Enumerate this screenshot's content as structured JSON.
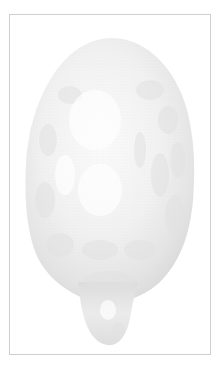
{
  "figure": {
    "colors": {
      "background": "#ffffff",
      "frame_border": "#cfcfcf",
      "body_light": "#f2f2f2",
      "body_mid": "#e3e3e3",
      "body_shadow": "#d2d2d2"
    }
  }
}
